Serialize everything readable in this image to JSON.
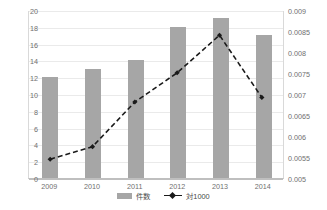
{
  "chart_data": {
    "type": "bar",
    "title": "",
    "subtitle": "",
    "xlabel": "",
    "ylabel": "",
    "categories": [
      "2009",
      "2010",
      "2011",
      "2012",
      "2013",
      "2014"
    ],
    "grid": true,
    "legend_position": "bottom",
    "axes": {
      "left": {
        "label": "",
        "min": 0,
        "max": 20,
        "step": 2,
        "ticks": [
          "0",
          "2",
          "4",
          "6",
          "8",
          "10",
          "12",
          "14",
          "16",
          "18",
          "20"
        ],
        "tick_values": [
          0,
          2,
          4,
          6,
          8,
          10,
          12,
          14,
          16,
          18,
          20
        ]
      },
      "right": {
        "label": "",
        "min": 0.005,
        "max": 0.009,
        "step": 0.0005,
        "ticks": [
          "0.005",
          "0.0055",
          "0.006",
          "0.0065",
          "0.007",
          "0.0075",
          "0.008",
          "0.0085",
          "0.009"
        ],
        "tick_values": [
          0.005,
          0.0055,
          0.006,
          0.0065,
          0.007,
          0.0075,
          0.008,
          0.0085,
          0.009
        ]
      }
    },
    "series": [
      {
        "name": "件数",
        "type": "bar",
        "axis": "left",
        "color": "#a6a6a6",
        "values": [
          12,
          13,
          14,
          18,
          19,
          17
        ]
      },
      {
        "name": "対1000",
        "type": "line",
        "axis": "right",
        "color": "#1a1a1a",
        "line_style": "dashed",
        "marker": "diamond",
        "values": [
          0.00545,
          0.00575,
          0.00682,
          0.00752,
          0.00842,
          0.00693
        ]
      }
    ]
  },
  "legend": {
    "items": [
      {
        "label": "件数",
        "swatch": "bar-swatch",
        "color": "#a6a6a6"
      },
      {
        "label": "対1000",
        "swatch": "line-swatch",
        "color": "#1a1a1a"
      }
    ]
  },
  "colors": {
    "bar": "#a6a6a6",
    "line": "#1a1a1a",
    "grid": "#eaeaea",
    "axis": "#bfbfbf",
    "tick_text": "#6f6f6f",
    "background": "#ffffff"
  }
}
